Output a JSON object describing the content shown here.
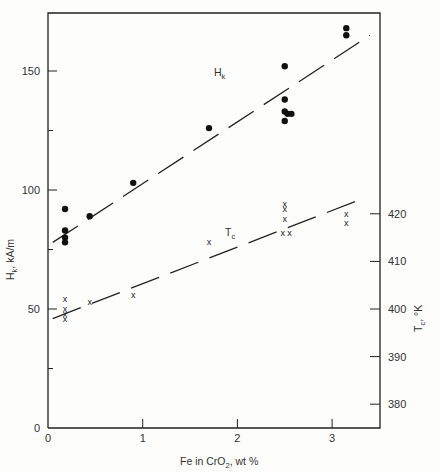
{
  "chart_data": {
    "type": "scatter",
    "title": "",
    "xlabel": "Fe in CrO2, wt %",
    "ylabel": "Hk, kA/m",
    "y2label": "Tc, oK",
    "xlim": [
      0,
      3.5
    ],
    "ylim": [
      0,
      175
    ],
    "y2lim": [
      376,
      437
    ],
    "x_ticks": [
      0,
      1,
      2,
      3
    ],
    "y_ticks": [
      0,
      50,
      100,
      150
    ],
    "y2_ticks": [
      380,
      390,
      400,
      410,
      420
    ],
    "grid": false,
    "series": [
      {
        "name": "Hk",
        "axis": "left",
        "marker": "filled-circle",
        "points": [
          [
            0.18,
            92
          ],
          [
            0.18,
            83
          ],
          [
            0.18,
            80
          ],
          [
            0.18,
            78
          ],
          [
            0.44,
            89
          ],
          [
            0.9,
            103
          ],
          [
            1.7,
            126
          ],
          [
            2.5,
            152
          ],
          [
            2.5,
            138
          ],
          [
            2.5,
            133
          ],
          [
            2.53,
            132
          ],
          [
            2.57,
            132
          ],
          [
            2.5,
            129
          ],
          [
            3.15,
            168
          ],
          [
            3.15,
            165
          ]
        ],
        "fit_line": {
          "style": "dashed",
          "from": [
            0.05,
            78
          ],
          "to": [
            3.4,
            165
          ]
        }
      },
      {
        "name": "Tc",
        "axis": "right",
        "marker": "x",
        "points": [
          [
            0.18,
            402
          ],
          [
            0.18,
            400
          ],
          [
            0.18,
            399
          ],
          [
            0.18,
            398
          ],
          [
            0.44,
            401.5
          ],
          [
            0.9,
            403
          ],
          [
            1.7,
            414
          ],
          [
            2.5,
            422
          ],
          [
            2.5,
            421
          ],
          [
            2.5,
            419
          ],
          [
            2.48,
            416
          ],
          [
            2.55,
            416
          ],
          [
            3.15,
            420
          ],
          [
            3.15,
            418
          ]
        ],
        "fit_line": {
          "style": "dashed",
          "from": [
            0.05,
            398
          ],
          "to": [
            3.3,
            423
          ]
        }
      }
    ],
    "annotations": [
      {
        "text": "Hk",
        "x": 1.85,
        "y": 150
      },
      {
        "text": "Tc",
        "x": 1.9,
        "y": 409
      }
    ]
  },
  "labels": {
    "x_axis_title_pre": "Fe in CrO",
    "x_axis_title_sub": "2",
    "x_axis_title_post": ", wt %",
    "y_axis_title_main": "H",
    "y_axis_title_sub": "k",
    "y_axis_title_post": ", kA/m",
    "y2_axis_title_main": "T",
    "y2_axis_title_sub": "c",
    "y2_axis_title_post": ", °K",
    "hk_label_main": "H",
    "hk_label_sub": "k",
    "tc_label_main": "T",
    "tc_label_sub": "c"
  }
}
